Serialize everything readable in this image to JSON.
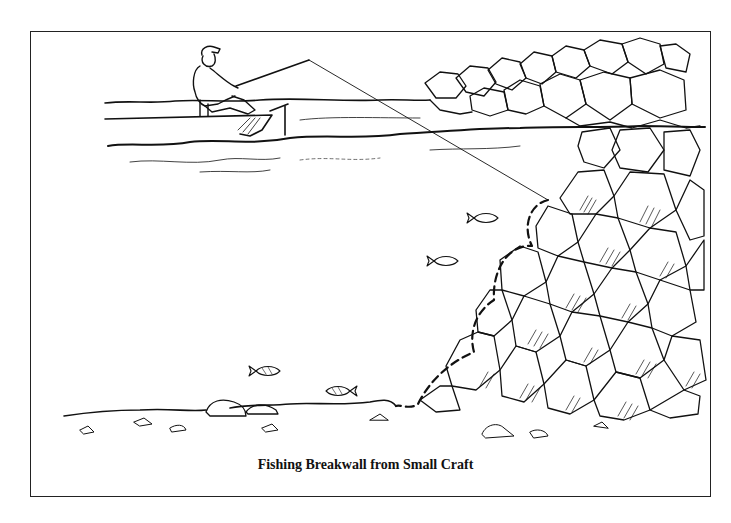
{
  "figure": {
    "caption": "Fishing Breakwall from Small Craft",
    "elements": [
      {
        "name": "fisherman",
        "description": "Angler with cap seated in small boat holding fishing rod"
      },
      {
        "name": "boat",
        "description": "Small craft on water surface"
      },
      {
        "name": "fishing-line",
        "description": "Line running from rod tip diagonally down to breakwall rocks"
      },
      {
        "name": "breakwall",
        "description": "Pile of large stones forming breakwall, extending above and below waterline"
      },
      {
        "name": "fish",
        "count": 4,
        "description": "Fish swimming near the breakwall and lake bottom"
      },
      {
        "name": "dashed-path",
        "description": "Dashed line indicating lure retrieval path along rock face"
      },
      {
        "name": "lake-bottom",
        "description": "Sandy bottom with scattered rocks"
      }
    ]
  },
  "colors": {
    "ink": "#111111",
    "background": "#ffffff"
  }
}
